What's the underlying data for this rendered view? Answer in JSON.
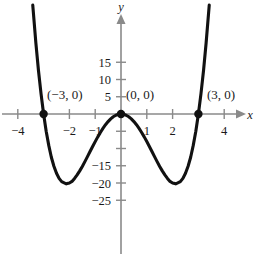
{
  "figure": {
    "name": "quartic-graph",
    "background_color": "#ffffff",
    "curve_color": "#111111",
    "axis_color": "#8a8a8a",
    "text_color": "#1a1a1a"
  },
  "axes": {
    "x_name": "x",
    "y_name": "y",
    "x_ticks": [
      {
        "value": -4,
        "label": "−4",
        "show_label": true
      },
      {
        "value": -3,
        "label": "",
        "show_label": false
      },
      {
        "value": -2,
        "label": "−2",
        "show_label": true
      },
      {
        "value": -1,
        "label": "−1",
        "show_label": true
      },
      {
        "value": 1,
        "label": "1",
        "show_label": true
      },
      {
        "value": 2,
        "label": "2",
        "show_label": true
      },
      {
        "value": 3,
        "label": "",
        "show_label": false
      },
      {
        "value": 4,
        "label": "4",
        "show_label": true
      }
    ],
    "y_ticks": [
      {
        "value": 15,
        "label": "15",
        "show_label": true
      },
      {
        "value": 10,
        "label": "10",
        "show_label": true
      },
      {
        "value": 5,
        "label": "5",
        "show_label": true
      },
      {
        "value": -5,
        "label": "",
        "show_label": false
      },
      {
        "value": -10,
        "label": "",
        "show_label": false
      },
      {
        "value": -15,
        "label": "−15",
        "show_label": true
      },
      {
        "value": -20,
        "label": "−20",
        "show_label": true
      },
      {
        "value": -25,
        "label": "−25",
        "show_label": true
      }
    ],
    "xlim": [
      -4.6,
      5.4
    ],
    "ylim": [
      -28.5,
      19.5
    ],
    "grid": false
  },
  "points": [
    {
      "id": "root-left",
      "label": "(−3, 0)",
      "x": -3,
      "y": 0
    },
    {
      "id": "root-origin",
      "label": "(0, 0)",
      "x": 0,
      "y": 0
    },
    {
      "id": "root-right",
      "label": "(3, 0)",
      "x": 3,
      "y": 0
    }
  ],
  "chart_data": {
    "type": "line",
    "title": "",
    "xlabel": "x",
    "ylabel": "y",
    "xlim": [
      -4.6,
      5.4
    ],
    "ylim": [
      -28.5,
      19.5
    ],
    "grid": false,
    "legend": "none",
    "equation": "y = x^4 - 9x^2",
    "xtick_labels": [
      "−4",
      "−2",
      "−1",
      "1",
      "2",
      "4"
    ],
    "ytick_labels": [
      "15",
      "10",
      "5",
      "−15",
      "−20",
      "−25"
    ],
    "annotations": [
      "(−3, 0)",
      "(0, 0)",
      "(3, 0)"
    ],
    "roots": [
      -3,
      0,
      3
    ],
    "minima": [
      {
        "x": -2.12,
        "y": -20.25
      },
      {
        "x": 2.12,
        "y": -20.25
      }
    ],
    "maxima": [
      {
        "x": 0,
        "y": 0
      }
    ],
    "series": [
      {
        "name": "y = x^4 - 9x^2",
        "x": [
          -3.42,
          -3.3,
          -3.2,
          -3.1,
          -3.0,
          -2.9,
          -2.8,
          -2.7,
          -2.6,
          -2.5,
          -2.4,
          -2.3,
          -2.2,
          -2.12,
          -2.0,
          -1.9,
          -1.8,
          -1.7,
          -1.6,
          -1.5,
          -1.4,
          -1.3,
          -1.2,
          -1.1,
          -1.0,
          -0.9,
          -0.8,
          -0.7,
          -0.6,
          -0.5,
          -0.4,
          -0.3,
          -0.2,
          -0.1,
          0.0,
          0.1,
          0.2,
          0.3,
          0.4,
          0.5,
          0.6,
          0.7,
          0.8,
          0.9,
          1.0,
          1.1,
          1.2,
          1.3,
          1.4,
          1.5,
          1.6,
          1.7,
          1.8,
          1.9,
          2.0,
          2.12,
          2.2,
          2.3,
          2.4,
          2.5,
          2.6,
          2.7,
          2.8,
          2.9,
          3.0,
          3.1,
          3.2,
          3.3,
          3.42
        ],
        "y": [
          31.57,
          20.65,
          12.68,
          5.9,
          0.0,
          -5.02,
          -9.1,
          -12.53,
          -15.14,
          -17.19,
          -18.66,
          -19.6,
          -19.97,
          -20.25,
          -20.0,
          -19.55,
          -18.67,
          -17.66,
          -16.48,
          -15.19,
          -13.8,
          -12.36,
          -10.89,
          -9.43,
          -8.0,
          -6.63,
          -5.35,
          -4.17,
          -3.11,
          -2.19,
          -1.41,
          -0.8,
          -0.36,
          -0.09,
          0.0,
          -0.09,
          -0.36,
          -0.8,
          -1.41,
          -2.19,
          -3.11,
          -4.17,
          -5.35,
          -6.63,
          -8.0,
          -9.43,
          -10.89,
          -12.36,
          -13.8,
          -15.19,
          -16.48,
          -17.66,
          -18.67,
          -19.55,
          -20.0,
          -20.25,
          -19.97,
          -19.6,
          -18.66,
          -17.19,
          -15.14,
          -12.53,
          -9.1,
          -5.02,
          0.0,
          5.9,
          12.68,
          20.65,
          31.57
        ]
      }
    ]
  }
}
